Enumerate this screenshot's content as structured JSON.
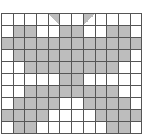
{
  "puzzle": {
    "cols": 12,
    "rows": 10,
    "colors": {
      "filled": "#bdbdbd",
      "empty": "#ffffff",
      "line": "#555555"
    },
    "cells": [
      "0000T00U0000",
      "011001100110",
      "111111111111",
      "011111111110",
      "001111111100",
      "000001100000",
      "001111111100",
      "011110011110",
      "111100001111",
      "011000000110"
    ],
    "legend": {
      "1": "filled",
      "0": "empty",
      "T": "triangle-upper-right",
      "U": "triangle-upper-left"
    }
  }
}
